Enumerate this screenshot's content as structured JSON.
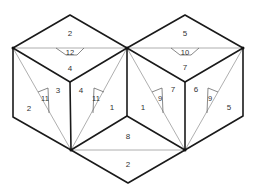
{
  "diagram": {
    "type": "polyhedron-net",
    "colors": {
      "edge": "#1a1a1a",
      "fold_line": "#9a9a9a",
      "label": "#333333",
      "background": "#ffffff"
    },
    "left_cube": {
      "top_face": {
        "upper_label": "2",
        "small_triangle_label": "12",
        "lower_label": "4"
      },
      "left_face": {
        "outer_label": "2",
        "inner_label": "3",
        "small_triangle_label": "11"
      },
      "right_face": {
        "inner_label": "4",
        "outer_label": "1",
        "small_triangle_label": "11"
      }
    },
    "right_cube": {
      "top_face": {
        "upper_label": "5",
        "small_triangle_label": "10",
        "lower_label": "7"
      },
      "left_face": {
        "outer_label": "1",
        "inner_label": "7",
        "small_triangle_label": "9"
      },
      "right_face": {
        "inner_label": "6",
        "outer_label": "5",
        "small_triangle_label": "9"
      }
    },
    "bottom_rhombus": {
      "upper_label": "8",
      "lower_label": "2"
    }
  }
}
